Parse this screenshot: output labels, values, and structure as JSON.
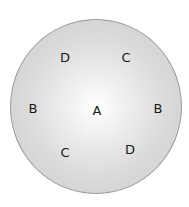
{
  "diagram": {
    "shape": "circle",
    "labels": [
      {
        "id": "top-left",
        "text": "D",
        "x": 65,
        "y": 57
      },
      {
        "id": "top-right",
        "text": "C",
        "x": 126,
        "y": 57
      },
      {
        "id": "left",
        "text": "B",
        "x": 33,
        "y": 108
      },
      {
        "id": "center",
        "text": "A",
        "x": 97,
        "y": 110
      },
      {
        "id": "right",
        "text": "B",
        "x": 158,
        "y": 108
      },
      {
        "id": "bottom-left",
        "text": "C",
        "x": 65,
        "y": 152
      },
      {
        "id": "bottom-right",
        "text": "D",
        "x": 130,
        "y": 149
      }
    ]
  }
}
